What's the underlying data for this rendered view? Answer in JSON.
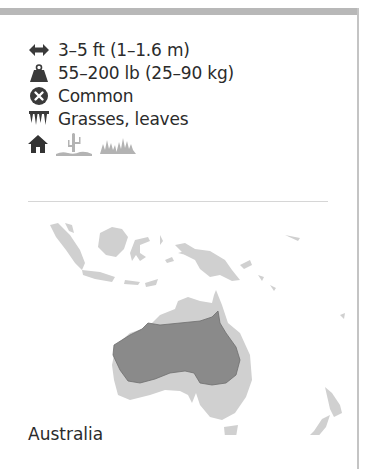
{
  "card": {
    "facts": [
      {
        "icon": "length-arrows-icon",
        "text": "3–5 ft (1–1.6 m)"
      },
      {
        "icon": "weight-icon",
        "text": "55–200 lb (25–90 kg)"
      },
      {
        "icon": "status-common-icon",
        "text": "Common"
      },
      {
        "icon": "teeth-diet-icon",
        "text": "Grasses, leaves"
      }
    ],
    "habitats": [
      {
        "icon": "home-habitat-icon",
        "active": true
      },
      {
        "icon": "desert-cactus-icon",
        "active": false
      },
      {
        "icon": "grassland-icon",
        "active": false
      }
    ],
    "map": {
      "region_label": "Australia",
      "colors": {
        "land": "#d0d0d0",
        "range": "#8a8a8a",
        "outline_range": "#6e6e6e"
      }
    }
  }
}
